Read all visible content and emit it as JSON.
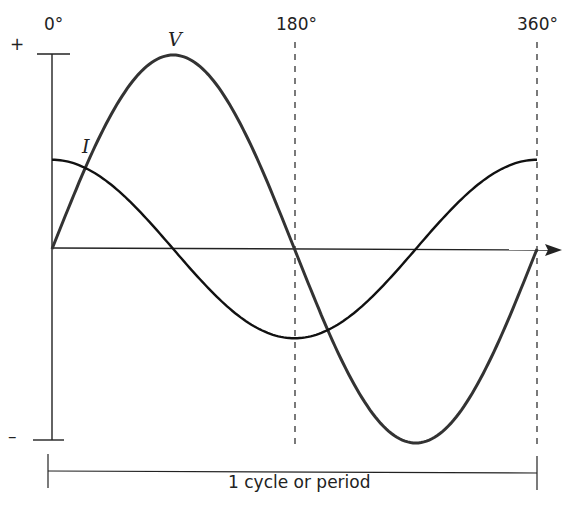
{
  "chart_data": {
    "type": "line",
    "title": "",
    "xlabel": "",
    "ylabel": "",
    "x_ticks": [
      "0°",
      "180°",
      "360°"
    ],
    "y_ticks": [
      "+",
      "−"
    ],
    "series": [
      {
        "name": "V",
        "description": "sine wave, amplitude 1.0",
        "x_deg": [
          0,
          90,
          180,
          270,
          360
        ],
        "values": [
          0,
          1,
          0,
          -1,
          0
        ]
      },
      {
        "name": "I",
        "description": "cosine wave, amplitude ~0.46",
        "x_deg": [
          0,
          90,
          180,
          270,
          360
        ],
        "values": [
          0.46,
          0,
          -0.46,
          0,
          0.46
        ]
      }
    ],
    "annotations": [
      "1 cycle or period"
    ],
    "grid": false
  },
  "labels": {
    "plus": "+",
    "minus": "–",
    "deg0": "0°",
    "deg180": "180°",
    "deg360": "360°",
    "v": "V",
    "i": "I",
    "period": "1 cycle or period"
  }
}
